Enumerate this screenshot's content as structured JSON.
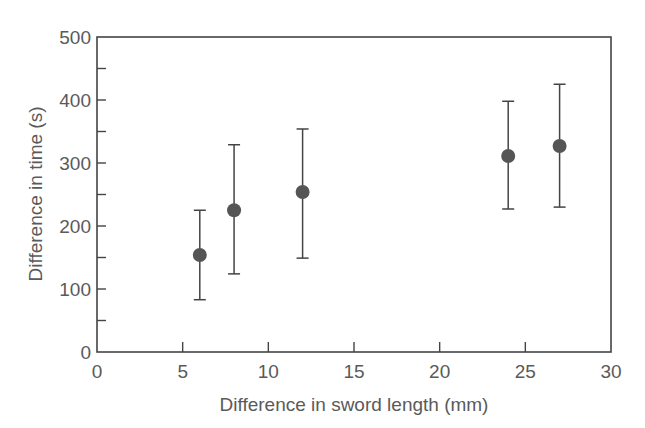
{
  "chart_data": {
    "type": "scatter",
    "title": "",
    "xlabel": "Difference in sword length (mm)",
    "ylabel": "Difference in time (s)",
    "xlim": [
      0,
      30
    ],
    "ylim": [
      0,
      500
    ],
    "x_ticks": [
      0,
      5,
      10,
      15,
      20,
      25,
      30
    ],
    "y_ticks": [
      0,
      100,
      200,
      300,
      400,
      500
    ],
    "y_minor_ticks": [
      50,
      150,
      250,
      350,
      450
    ],
    "grid": false,
    "legend": null,
    "error_bars": true,
    "series": [
      {
        "name": "measurements",
        "points": [
          {
            "x": 6,
            "y": 154,
            "y_low": 83,
            "y_high": 225
          },
          {
            "x": 8,
            "y": 225,
            "y_low": 124,
            "y_high": 329
          },
          {
            "x": 12,
            "y": 254,
            "y_low": 149,
            "y_high": 354
          },
          {
            "x": 24,
            "y": 311,
            "y_low": 227,
            "y_high": 398
          },
          {
            "x": 27,
            "y": 327,
            "y_low": 230,
            "y_high": 425
          }
        ]
      }
    ]
  },
  "style": {
    "axis_color": "#444444",
    "marker_color": "#555555",
    "errorbar_color": "#444444",
    "text_color": "#5a5a5a"
  }
}
